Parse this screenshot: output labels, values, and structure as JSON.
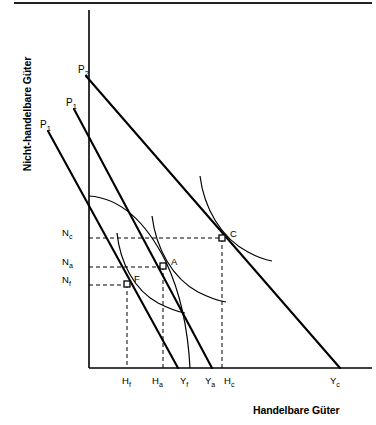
{
  "figure": {
    "kind": "economics-diagram",
    "axes": {
      "y_title": "Nicht-handelbare Güter",
      "x_title": "Handelbare Güter",
      "origin_px": [
        89,
        368
      ],
      "y_top_px": 10,
      "x_right_px": 372
    },
    "y_ticks": [
      {
        "id": "Nc",
        "text": "N",
        "sub": "c",
        "y_px": 232,
        "dash_to_x_px": 222
      },
      {
        "id": "Na",
        "text": "N",
        "sub": "a",
        "y_px": 261,
        "dash_to_x_px": 163
      },
      {
        "id": "Nf",
        "text": "N",
        "sub": "f",
        "y_px": 279,
        "dash_to_x_px": 127
      }
    ],
    "x_ticks": [
      {
        "id": "Hf",
        "text": "H",
        "sub": "f",
        "x_px": 122,
        "dash_from_y_px": 284
      },
      {
        "id": "Ha",
        "text": "H",
        "sub": "a",
        "x_px": 152,
        "dash_from_y_px": 266
      },
      {
        "id": "Yf",
        "text": "Y",
        "sub": "f",
        "x_px": 180,
        "dash_from_y_px": null
      },
      {
        "id": "Ya",
        "text": "Y",
        "sub": "a",
        "x_px": 205,
        "dash_from_y_px": null
      },
      {
        "id": "Hc",
        "text": "H",
        "sub": "c",
        "x_px": 224,
        "dash_from_y_px": 238
      },
      {
        "id": "Yc",
        "text": "Y",
        "sub": "c",
        "x_px": 330,
        "dash_from_y_px": null
      }
    ],
    "price_lines": [
      {
        "id": "p1-inner",
        "text": "P",
        "sub": "1",
        "label_x_px": 40,
        "label_y_px": 119,
        "x1": 48,
        "y1": 131,
        "x2": 178,
        "y2": 368
      },
      {
        "id": "p1-middle",
        "text": "P",
        "sub": "1",
        "label_x_px": 66,
        "label_y_px": 97,
        "x1": 74,
        "y1": 109,
        "x2": 212,
        "y2": 368
      },
      {
        "id": "p2-outer",
        "text": "P",
        "sub": "2",
        "label_x_px": 78,
        "label_y_px": 64,
        "x1": 86,
        "y1": 76,
        "x2": 340,
        "y2": 368
      }
    ],
    "points": [
      {
        "id": "A",
        "label": "A",
        "x_px": 163,
        "y_px": 266,
        "label_dx": 8,
        "label_dy": -3
      },
      {
        "id": "C",
        "label": "C",
        "x_px": 222,
        "y_px": 238,
        "label_dx": 8,
        "label_dy": -3
      },
      {
        "id": "F",
        "label": "F",
        "x_px": 127,
        "y_px": 284,
        "label_dx": 7,
        "label_dy": -4
      }
    ],
    "curves": {
      "ppf": "M89,196 C 120,198 146,222 166,262 C 180,292 188,330 190,368",
      "indifference_F": "M117,233 C 120,262 134,290 158,303 C 170,309 178,312 185,313",
      "indifference_A": "M152,216 C 156,248 172,278 198,292 C 210,298 218,301 226,302",
      "indifference_C": "M200,176 C 204,208 221,238 248,252 C 259,258 266,260 272,261"
    }
  }
}
